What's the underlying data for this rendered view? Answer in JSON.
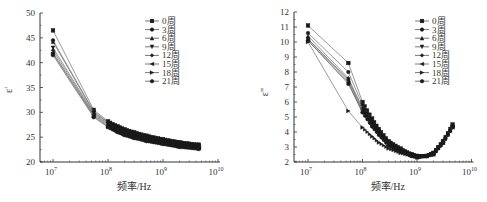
{
  "chart_data": [
    {
      "type": "line",
      "id": "left",
      "title": "",
      "xlabel": "频率/Hz",
      "ylabel": "ε'",
      "xscale": "log",
      "xlim": [
        5000000.0,
        10000000000.0
      ],
      "ylim": [
        20,
        50
      ],
      "yticks": [
        20,
        25,
        30,
        35,
        40,
        45,
        50
      ],
      "xticks": [
        "10^7",
        "10^8",
        "10^9",
        "10^10"
      ],
      "xtick_labels": [
        {
          "base": "10",
          "exp": "7"
        },
        {
          "base": "10",
          "exp": "8"
        },
        {
          "base": "10",
          "exp": "9"
        },
        {
          "base": "10",
          "exp": "10"
        }
      ],
      "grid": false,
      "legend_position": "upper right",
      "x": [
        10000000.0,
        55000000.0,
        100000000.0,
        150000000.0,
        200000000.0,
        300000000.0,
        500000000.0,
        1000000000.0,
        2000000000.0,
        4500000000.0
      ],
      "series": [
        {
          "name": "0周",
          "marker": "square",
          "values": [
            46.5,
            30.5,
            28.2,
            27.2,
            26.6,
            26.0,
            25.3,
            24.6,
            24.0,
            23.5
          ]
        },
        {
          "name": "3周",
          "marker": "circle",
          "values": [
            44.5,
            30.2,
            28.0,
            27.0,
            26.4,
            25.8,
            25.1,
            24.4,
            23.8,
            23.3
          ]
        },
        {
          "name": "6周",
          "marker": "triangle-up",
          "values": [
            44.2,
            30.0,
            27.9,
            26.9,
            26.3,
            25.7,
            25.0,
            24.3,
            23.7,
            23.2
          ]
        },
        {
          "name": "9周",
          "marker": "triangle-down",
          "values": [
            43.0,
            29.8,
            27.7,
            26.7,
            26.1,
            25.5,
            24.8,
            24.1,
            23.5,
            23.0
          ]
        },
        {
          "name": "12周",
          "marker": "diamond",
          "values": [
            42.5,
            29.6,
            27.5,
            26.5,
            25.9,
            25.3,
            24.6,
            23.9,
            23.3,
            22.9
          ]
        },
        {
          "name": "15周",
          "marker": "triangle-left",
          "values": [
            42.0,
            29.4,
            27.3,
            26.3,
            25.7,
            25.1,
            24.4,
            23.8,
            23.2,
            22.8
          ]
        },
        {
          "name": "18周",
          "marker": "triangle-right",
          "values": [
            41.8,
            29.2,
            27.1,
            26.1,
            25.5,
            24.9,
            24.3,
            23.7,
            23.1,
            22.7
          ]
        },
        {
          "name": "21周",
          "marker": "hexagon",
          "values": [
            41.5,
            29.0,
            27.0,
            26.0,
            25.4,
            24.8,
            24.2,
            23.6,
            23.0,
            22.6
          ]
        }
      ]
    },
    {
      "type": "line",
      "id": "right",
      "title": "",
      "xlabel": "频率/Hz",
      "ylabel": "ε\"",
      "xscale": "log",
      "xlim": [
        5000000.0,
        10000000000.0
      ],
      "ylim": [
        2,
        12
      ],
      "yticks": [
        2,
        3,
        4,
        5,
        6,
        7,
        8,
        9,
        10,
        11,
        12
      ],
      "xticks": [
        "10^7",
        "10^8",
        "10^9",
        "10^10"
      ],
      "xtick_labels": [
        {
          "base": "10",
          "exp": "7"
        },
        {
          "base": "10",
          "exp": "8"
        },
        {
          "base": "10",
          "exp": "9"
        },
        {
          "base": "10",
          "exp": "10"
        }
      ],
      "grid": false,
      "legend_position": "upper right",
      "x": [
        10000000.0,
        55000000.0,
        100000000.0,
        150000000.0,
        200000000.0,
        300000000.0,
        500000000.0,
        800000000.0,
        1000000000.0,
        1500000000.0,
        2000000000.0,
        3000000000.0,
        4500000000.0
      ],
      "series": [
        {
          "name": "0周",
          "marker": "square",
          "values": [
            11.1,
            8.6,
            6.0,
            4.9,
            4.2,
            3.4,
            2.9,
            2.5,
            2.4,
            2.4,
            2.6,
            3.4,
            4.5
          ]
        },
        {
          "name": "3周",
          "marker": "circle",
          "values": [
            10.6,
            8.0,
            5.8,
            4.7,
            4.1,
            3.3,
            2.8,
            2.5,
            2.4,
            2.4,
            2.6,
            3.4,
            4.4
          ]
        },
        {
          "name": "6周",
          "marker": "triangle-up",
          "values": [
            10.4,
            7.6,
            5.6,
            4.6,
            4.0,
            3.2,
            2.8,
            2.5,
            2.4,
            2.4,
            2.6,
            3.3,
            4.4
          ]
        },
        {
          "name": "9周",
          "marker": "triangle-down",
          "values": [
            10.2,
            7.5,
            5.5,
            4.5,
            3.9,
            3.2,
            2.7,
            2.5,
            2.4,
            2.4,
            2.6,
            3.3,
            4.3
          ]
        },
        {
          "name": "12周",
          "marker": "diamond",
          "values": [
            10.2,
            7.4,
            5.4,
            4.4,
            3.9,
            3.1,
            2.7,
            2.4,
            2.4,
            2.4,
            2.6,
            3.3,
            4.3
          ]
        },
        {
          "name": "15周",
          "marker": "triangle-left",
          "values": [
            10.1,
            7.3,
            5.3,
            4.3,
            3.8,
            3.1,
            2.7,
            2.4,
            2.3,
            2.4,
            2.5,
            3.3,
            4.3
          ]
        },
        {
          "name": "18周",
          "marker": "triangle-right",
          "values": [
            10.0,
            5.4,
            4.3,
            3.7,
            3.3,
            2.9,
            2.6,
            2.4,
            2.3,
            2.4,
            2.5,
            3.2,
            4.3
          ]
        },
        {
          "name": "21周",
          "marker": "hexagon",
          "values": [
            10.1,
            7.2,
            5.3,
            4.4,
            3.8,
            3.1,
            2.7,
            2.4,
            2.3,
            2.4,
            2.5,
            3.3,
            4.4
          ]
        }
      ]
    }
  ],
  "colors": {
    "line": "#555555",
    "marker": "#1a1a1a",
    "axis": "#333333",
    "text": "#333333",
    "background": "#ffffff"
  }
}
